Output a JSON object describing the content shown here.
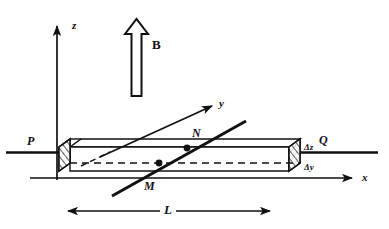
{
  "figure": {
    "background_color": "#ffffff",
    "ink_color": "#111111",
    "width": 389,
    "height": 229
  },
  "axes": {
    "z": {
      "label": "z",
      "style": "italic",
      "direction": "up",
      "origin": [
        57,
        148
      ],
      "tip": [
        57,
        18
      ]
    },
    "y": {
      "label": "y",
      "style": "italic",
      "direction": "up-right",
      "origin": [
        97,
        160
      ],
      "tip": [
        215,
        104
      ]
    },
    "x": {
      "label": "x",
      "style": "italic",
      "direction": "right",
      "origin": [
        57,
        178
      ],
      "tip": [
        355,
        178
      ]
    }
  },
  "field": {
    "label": "B",
    "style": "bold-upright",
    "arrow_type": "hollow-outline-arrow",
    "direction": "up",
    "shaft_bottom": [
      136,
      96
    ],
    "tip": [
      136,
      20
    ]
  },
  "bar": {
    "description": "long rectangular conducting bar drawn in oblique projection",
    "length_label": "L",
    "end_faces": {
      "left": {
        "label": "P",
        "hatched": true
      },
      "right": {
        "label": "Q",
        "hatched": true
      }
    },
    "cross_section_labels": {
      "height": "Δz",
      "depth": "Δy"
    },
    "front_top_left": [
      70,
      148
    ],
    "front_bottom_right": [
      300,
      172
    ]
  },
  "points": [
    {
      "name": "N",
      "label": "N",
      "style": "italic",
      "label_pos": [
        194,
        128
      ],
      "dot_pos": [
        186,
        150
      ]
    },
    {
      "name": "M",
      "label": "M",
      "style": "italic",
      "label_pos": [
        146,
        180
      ],
      "dot_pos": [
        160,
        163
      ]
    }
  ],
  "conductor_line": {
    "description": "thick straight line through the bar passing through M and N",
    "from": [
      112,
      196
    ],
    "to": [
      248,
      120
    ]
  },
  "dimension": {
    "label": "L",
    "style": "italic",
    "arrow_type": "double-headed",
    "left_end": [
      60,
      211
    ],
    "right_end": [
      277,
      211
    ],
    "label_pos": [
      166,
      205
    ]
  },
  "terminals": {
    "left": {
      "label": "P",
      "label_pos": [
        29,
        141
      ],
      "lead_from": [
        6,
        152
      ],
      "lead_to": [
        62,
        152
      ]
    },
    "right": {
      "label": "Q",
      "label_pos": [
        320,
        141
      ],
      "lead_from": [
        296,
        152
      ],
      "lead_to": [
        375,
        152
      ]
    }
  }
}
